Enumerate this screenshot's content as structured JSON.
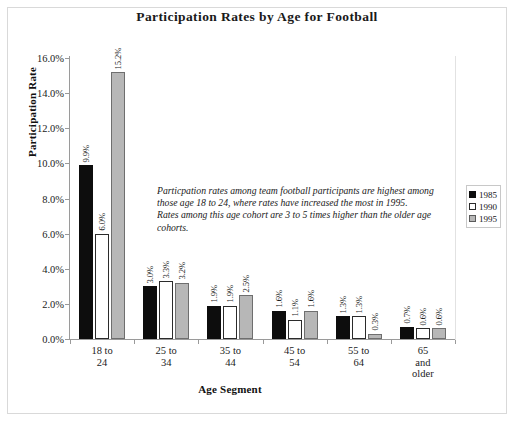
{
  "chart_data": {
    "type": "bar",
    "title": "Participation Rates by Age for Football",
    "xlabel": "Age Segment",
    "ylabel": "Participation Rate",
    "categories": [
      "18 to\n24",
      "25 to\n34",
      "35 to\n44",
      "45 to\n54",
      "55 to\n64",
      "65\nand\nolder"
    ],
    "category_lines": [
      [
        "18 to",
        "24"
      ],
      [
        "25 to",
        "34"
      ],
      [
        "35 to",
        "44"
      ],
      [
        "45 to",
        "54"
      ],
      [
        "55 to",
        "64"
      ],
      [
        "65",
        "and",
        "older"
      ]
    ],
    "series": [
      {
        "name": "1985",
        "color": "#0d0d0d",
        "values": [
          9.9,
          3.0,
          1.9,
          1.6,
          1.3,
          0.7
        ],
        "labels": [
          "9.9%",
          "3.0%",
          "1.9%",
          "1.6%",
          "1.3%",
          "0.7%"
        ]
      },
      {
        "name": "1990",
        "color": "#ffffff",
        "values": [
          6.0,
          3.3,
          1.9,
          1.1,
          1.3,
          0.6
        ],
        "labels": [
          "6.0%",
          "3.3%",
          "1.9%",
          "1.1%",
          "1.3%",
          "0.6%"
        ]
      },
      {
        "name": "1995",
        "color": "#b7b7b7",
        "values": [
          15.2,
          3.2,
          2.5,
          1.6,
          0.3,
          0.6
        ],
        "labels": [
          "15.2%",
          "3.2%",
          "2.5%",
          "1.6%",
          "0.3%",
          "0.6%"
        ]
      }
    ],
    "ylim": [
      0,
      16
    ],
    "ytick_values": [
      0,
      2,
      4,
      6,
      8,
      10,
      12,
      14,
      16
    ],
    "ytick_labels": [
      "0.0%",
      "2.0%",
      "4.0%",
      "6.0%",
      "8.0%",
      "10.0%",
      "12.0%",
      "14.0%",
      "16.0%"
    ],
    "grid": false,
    "legend_position": "right",
    "annotation_lines": [
      "Particpation rates among team football participants are highest among",
      "those age 18 to 24, where rates have increased the most in 1995.",
      "Rates among this age cohort are 3 to 5 times higher than the older age",
      "cohorts."
    ]
  }
}
